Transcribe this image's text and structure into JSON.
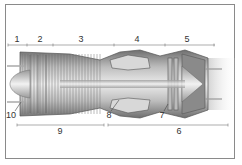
{
  "diagram": {
    "type": "turbojet engine cutaway",
    "top_labels": [
      {
        "id": "1",
        "text": "1",
        "x": 17,
        "y": 35
      },
      {
        "id": "2",
        "text": "2",
        "x": 40,
        "y": 35
      },
      {
        "id": "3",
        "text": "3",
        "x": 81,
        "y": 35
      },
      {
        "id": "4",
        "text": "4",
        "x": 137,
        "y": 35
      },
      {
        "id": "5",
        "text": "5",
        "x": 187,
        "y": 35
      }
    ],
    "callout_labels": [
      {
        "id": "10",
        "text": "10",
        "x": 11,
        "y": 111
      },
      {
        "id": "8",
        "text": "8",
        "x": 109,
        "y": 111
      },
      {
        "id": "7",
        "text": "7",
        "x": 162,
        "y": 111
      }
    ],
    "bottom_labels": [
      {
        "id": "9",
        "text": "9",
        "x": 60,
        "y": 127
      },
      {
        "id": "6",
        "text": "6",
        "x": 179,
        "y": 127
      }
    ],
    "colors": {
      "frame": "#8a8a8a",
      "line": "#555555",
      "metal_dark": "#6e6e6e",
      "metal_mid": "#a8a8a8",
      "metal_light": "#e4e4e4"
    }
  }
}
